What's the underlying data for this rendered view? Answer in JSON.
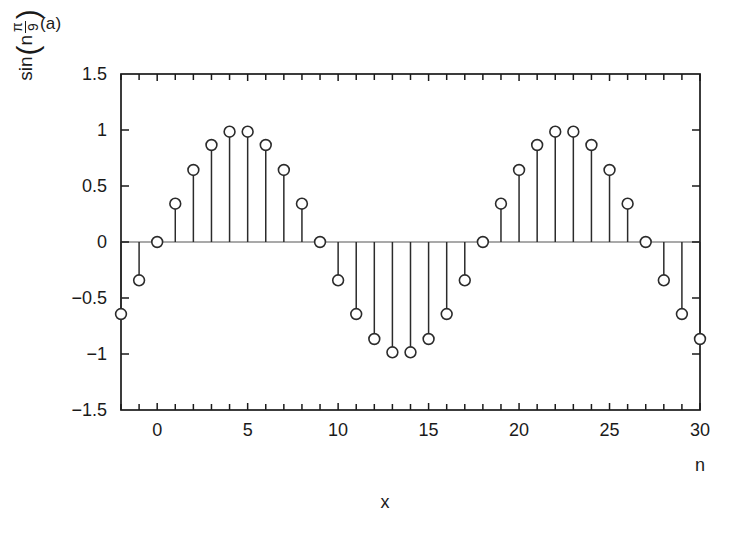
{
  "figure": {
    "panel_label": "(a)",
    "background": "#ffffff",
    "foreground": "#1a1a1a"
  },
  "ylabel": {
    "function_name": "sin",
    "open_paren": "(",
    "variable": "n",
    "fraction_numerator": "π",
    "fraction_denominator": "9",
    "close_paren": ")"
  },
  "axis_labels": {
    "x_bottom": "x",
    "x_right": "n"
  },
  "chart_data": {
    "type": "scatter",
    "subtype": "stem",
    "title": "(a)",
    "xlabel": "x",
    "ylabel": "sin(n π/9)",
    "x_secondary_label": "n",
    "xlim": [
      -2,
      30
    ],
    "ylim": [
      -1.5,
      1.5
    ],
    "xticks": [
      0,
      5,
      10,
      15,
      20,
      25,
      30
    ],
    "xtick_labels": [
      "0",
      "5",
      "10",
      "15",
      "20",
      "25",
      "30"
    ],
    "x_minor_tick_step": 1,
    "yticks": [
      1.5,
      1,
      0.5,
      0,
      -0.5,
      -1,
      -1.5
    ],
    "ytick_labels": [
      "1.5",
      "1",
      "0.5",
      "0",
      "-0.5",
      "-1",
      "-1.5"
    ],
    "grid": false,
    "legend": null,
    "marker": "open-circle",
    "marker_color": "#2b2b2b",
    "marker_facecolor": "#ffffff",
    "stem_color": "#2b2b2b",
    "baseline": 0,
    "expression": "sin(n*pi/9)",
    "x": [
      -2,
      -1,
      0,
      1,
      2,
      3,
      4,
      5,
      6,
      7,
      8,
      9,
      10,
      11,
      12,
      13,
      14,
      15,
      16,
      17,
      18,
      19,
      20,
      21,
      22,
      23,
      24,
      25,
      26,
      27,
      28,
      29,
      30
    ],
    "y": [
      -0.643,
      -0.342,
      0.0,
      0.342,
      0.643,
      0.866,
      0.985,
      0.985,
      0.866,
      0.643,
      0.342,
      0.0,
      -0.342,
      -0.643,
      -0.866,
      -0.985,
      -0.985,
      -0.866,
      -0.643,
      -0.342,
      0.0,
      0.342,
      0.643,
      0.866,
      0.985,
      0.985,
      0.866,
      0.643,
      0.342,
      0.0,
      -0.342,
      -0.643,
      -0.866
    ]
  }
}
